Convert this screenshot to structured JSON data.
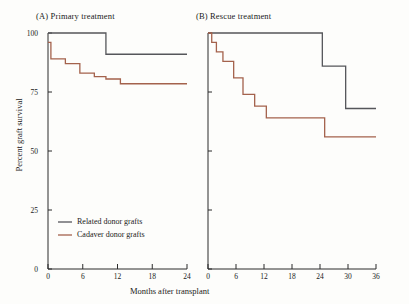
{
  "figure": {
    "x_axis_title": "Months after transplant",
    "y_axis_title": "Percent graft survival"
  },
  "panels": [
    {
      "id": "A",
      "label": "(A)  Primary treatment"
    },
    {
      "id": "B",
      "label": "(B)  Rescue treatment"
    }
  ],
  "legend": {
    "items": [
      {
        "label": "Related donor grafts",
        "color": "#55565a"
      },
      {
        "label": "Cadaver donor grafts",
        "color": "#a4624c"
      }
    ]
  },
  "axes": {
    "y_ticks": [
      "0",
      "25",
      "50",
      "75",
      "100"
    ],
    "panel_a_x_ticks": [
      "0",
      "6",
      "12",
      "18",
      "24"
    ],
    "panel_b_x_ticks": [
      "0",
      "6",
      "12",
      "18",
      "24",
      "30",
      "36"
    ]
  },
  "chart_data": {
    "type": "line",
    "xlabel": "Months after transplant",
    "ylabel": "Percent graft survival",
    "ylim": [
      0,
      100
    ],
    "grid": false,
    "legend_position": "lower-left",
    "panels": [
      {
        "id": "A",
        "title": "(A)  Primary treatment",
        "xlim": [
          0,
          24
        ],
        "xticks": [
          0,
          6,
          12,
          18,
          24
        ],
        "yticks": [
          0,
          25,
          50,
          75,
          100
        ],
        "series": [
          {
            "name": "Related donor grafts",
            "color": "#55565a",
            "style": "step",
            "x": [
              0,
              10,
              10,
              24
            ],
            "y": [
              100,
              100,
              91,
              91
            ]
          },
          {
            "name": "Cadaver donor grafts",
            "color": "#a4624c",
            "style": "step",
            "x": [
              0,
              0.5,
              0.5,
              3,
              3,
              5.5,
              5.5,
              8,
              8,
              10,
              10,
              12.5,
              12.5,
              24
            ],
            "y": [
              96,
              96,
              89,
              89,
              87,
              87,
              83,
              83,
              81.5,
              81.5,
              80.5,
              80.5,
              78.5,
              78.5
            ]
          }
        ]
      },
      {
        "id": "B",
        "title": "(B)  Rescue treatment",
        "xlim": [
          0,
          36
        ],
        "xticks": [
          0,
          6,
          12,
          18,
          24,
          30,
          36
        ],
        "yticks": [
          0,
          25,
          50,
          75,
          100
        ],
        "series": [
          {
            "name": "Related donor grafts",
            "color": "#55565a",
            "style": "step",
            "x": [
              0,
              24.5,
              24.5,
              29.5,
              29.5,
              36
            ],
            "y": [
              100,
              100,
              86,
              86,
              68,
              68
            ]
          },
          {
            "name": "Cadaver donor grafts",
            "color": "#a4624c",
            "style": "step",
            "x": [
              0,
              0.8,
              0.8,
              1.8,
              1.8,
              3.2,
              3.2,
              5.5,
              5.5,
              7.5,
              7.5,
              10,
              10,
              12.5,
              12.5,
              25,
              25,
              36
            ],
            "y": [
              100,
              100,
              96,
              96,
              92,
              92,
              88,
              88,
              81,
              81,
              74,
              74,
              69,
              69,
              64,
              64,
              56,
              56
            ]
          }
        ]
      }
    ]
  }
}
